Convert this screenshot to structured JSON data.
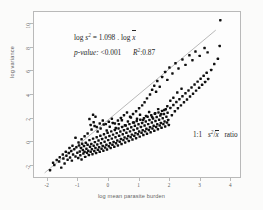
{
  "chart_data": {
    "type": "scatter",
    "title": "",
    "xlabel": "log mean parasite burden",
    "ylabel": "log variance",
    "xlim": [
      -2.45,
      4.35
    ],
    "ylim": [
      -3.1,
      11.0
    ],
    "xticks": [
      "-2",
      "-1",
      "0",
      "1",
      "2",
      "3",
      "4"
    ],
    "xtick_values": [
      -2,
      -1,
      0,
      1,
      2,
      3,
      4
    ],
    "yticks": [
      "10",
      "8",
      "6",
      "4",
      "2",
      "0",
      "-2"
    ],
    "ytick_values": [
      10,
      8,
      6,
      4,
      2,
      0,
      -2
    ],
    "grid": false,
    "legend": null,
    "marker_color": "#101010",
    "line_color": "#9a9a9a",
    "frame_color": "#b9b9b9",
    "regression_line": {
      "slope": 1.098,
      "x_start": -2.1,
      "y_start": -2.75,
      "x_end": 3.55,
      "y_end": 9.45
    },
    "annotations": {
      "equation": {
        "log_label": "log",
        "s_symbol": "s",
        "s_exponent": "2",
        "equals": "=",
        "slope_value": "1.098",
        "dot": ".",
        "log_label2": "log",
        "x_symbol": "x"
      },
      "stats": {
        "pvalue_label": "p-value:",
        "pvalue": "<0.001",
        "r2_label": "R",
        "r2_exponent": "2",
        "r2_sep": ":",
        "r2_value": "0.87"
      },
      "ratio": {
        "ratio_label": "1:1",
        "numerator": "s",
        "numerator_exp": "2",
        "slash": "/",
        "denominator": "x",
        "suffix": "ratio"
      }
    },
    "points": [
      [
        -1.92,
        -2.52
      ],
      [
        -1.78,
        -2.08
      ],
      [
        -1.62,
        -1.78
      ],
      [
        -1.55,
        -2.3
      ],
      [
        -1.48,
        -1.52
      ],
      [
        -1.44,
        -1.95
      ],
      [
        -1.38,
        -1.28
      ],
      [
        -1.34,
        -1.62
      ],
      [
        -1.3,
        -1.05
      ],
      [
        -1.26,
        -1.44
      ],
      [
        -1.22,
        -0.88
      ],
      [
        -1.2,
        -1.7
      ],
      [
        -1.16,
        -1.18
      ],
      [
        -1.12,
        -0.72
      ],
      [
        -1.08,
        -1.35
      ],
      [
        -1.05,
        -0.55
      ],
      [
        -1.02,
        -1.02
      ],
      [
        -0.99,
        -1.48
      ],
      [
        -0.96,
        -0.4
      ],
      [
        -0.94,
        -0.92
      ],
      [
        -0.92,
        -1.25
      ],
      [
        -0.9,
        -0.62
      ],
      [
        -0.88,
        -1.6
      ],
      [
        -0.86,
        -0.25
      ],
      [
        -0.84,
        -0.8
      ],
      [
        -0.82,
        -1.1
      ],
      [
        -0.8,
        -0.45
      ],
      [
        -0.78,
        -0.95
      ],
      [
        -0.76,
        -1.38
      ],
      [
        -0.74,
        -0.18
      ],
      [
        -0.72,
        -0.68
      ],
      [
        -0.7,
        -1.02
      ],
      [
        -0.68,
        -0.35
      ],
      [
        -0.66,
        -0.85
      ],
      [
        -0.64,
        -1.22
      ],
      [
        -0.62,
        0.05
      ],
      [
        -0.6,
        -0.52
      ],
      [
        -0.58,
        -0.95
      ],
      [
        -0.56,
        -0.28
      ],
      [
        -0.54,
        -0.72
      ],
      [
        -0.52,
        -1.15
      ],
      [
        -0.5,
        0.18
      ],
      [
        -0.5,
        2.22
      ],
      [
        -0.48,
        -0.42
      ],
      [
        -0.46,
        -0.88
      ],
      [
        -0.44,
        -0.12
      ],
      [
        -0.42,
        -0.62
      ],
      [
        -0.4,
        -1.05
      ],
      [
        -0.38,
        0.3
      ],
      [
        -0.36,
        -0.32
      ],
      [
        -0.34,
        -0.78
      ],
      [
        -0.32,
        0.02
      ],
      [
        -0.3,
        -0.55
      ],
      [
        -0.28,
        -0.95
      ],
      [
        -0.26,
        0.42
      ],
      [
        -0.24,
        -0.22
      ],
      [
        -0.22,
        -0.68
      ],
      [
        -0.2,
        0.15
      ],
      [
        -0.18,
        -0.45
      ],
      [
        -0.16,
        -0.85
      ],
      [
        -0.14,
        0.55
      ],
      [
        -0.12,
        -0.08
      ],
      [
        -0.1,
        -0.58
      ],
      [
        -0.08,
        0.28
      ],
      [
        -0.06,
        -0.35
      ],
      [
        -0.04,
        -0.75
      ],
      [
        -0.02,
        0.68
      ],
      [
        0.0,
        0.05
      ],
      [
        0.02,
        -0.48
      ],
      [
        0.04,
        0.4
      ],
      [
        0.06,
        -0.22
      ],
      [
        0.08,
        -0.62
      ],
      [
        0.1,
        0.8
      ],
      [
        0.12,
        0.18
      ],
      [
        0.14,
        -0.35
      ],
      [
        0.16,
        0.52
      ],
      [
        0.18,
        -0.1
      ],
      [
        0.2,
        -0.52
      ],
      [
        0.22,
        0.92
      ],
      [
        0.24,
        0.3
      ],
      [
        0.26,
        -0.22
      ],
      [
        0.28,
        0.65
      ],
      [
        0.3,
        0.02
      ],
      [
        0.32,
        -0.4
      ],
      [
        0.34,
        1.05
      ],
      [
        0.36,
        0.42
      ],
      [
        0.38,
        -0.08
      ],
      [
        0.4,
        0.78
      ],
      [
        0.42,
        0.15
      ],
      [
        0.44,
        -0.28
      ],
      [
        0.46,
        1.18
      ],
      [
        0.48,
        0.55
      ],
      [
        0.5,
        0.05
      ],
      [
        0.52,
        0.9
      ],
      [
        0.54,
        0.28
      ],
      [
        0.56,
        -0.15
      ],
      [
        0.58,
        1.3
      ],
      [
        0.6,
        0.68
      ],
      [
        0.62,
        0.18
      ],
      [
        0.64,
        1.02
      ],
      [
        0.66,
        0.4
      ],
      [
        0.68,
        -0.02
      ],
      [
        0.7,
        1.42
      ],
      [
        0.72,
        0.8
      ],
      [
        0.74,
        0.3
      ],
      [
        0.76,
        1.15
      ],
      [
        0.78,
        0.52
      ],
      [
        0.8,
        0.1
      ],
      [
        0.82,
        1.55
      ],
      [
        0.84,
        0.92
      ],
      [
        0.86,
        0.42
      ],
      [
        0.88,
        1.28
      ],
      [
        0.9,
        0.65
      ],
      [
        0.92,
        0.22
      ],
      [
        0.94,
        1.68
      ],
      [
        0.96,
        1.05
      ],
      [
        0.98,
        0.55
      ],
      [
        1.0,
        1.4
      ],
      [
        1.02,
        0.78
      ],
      [
        1.04,
        0.35
      ],
      [
        1.06,
        1.8
      ],
      [
        1.08,
        1.18
      ],
      [
        1.1,
        0.68
      ],
      [
        1.12,
        1.52
      ],
      [
        1.14,
        0.9
      ],
      [
        1.16,
        0.48
      ],
      [
        1.18,
        1.92
      ],
      [
        1.2,
        1.3
      ],
      [
        1.22,
        0.8
      ],
      [
        1.24,
        1.65
      ],
      [
        1.26,
        1.02
      ],
      [
        1.28,
        0.6
      ],
      [
        1.3,
        2.05
      ],
      [
        1.32,
        1.42
      ],
      [
        1.34,
        0.92
      ],
      [
        1.36,
        1.78
      ],
      [
        1.38,
        1.15
      ],
      [
        1.4,
        0.72
      ],
      [
        1.42,
        2.18
      ],
      [
        1.44,
        1.55
      ],
      [
        1.46,
        1.05
      ],
      [
        1.48,
        1.9
      ],
      [
        1.5,
        1.28
      ],
      [
        1.52,
        0.85
      ],
      [
        1.54,
        2.3
      ],
      [
        1.56,
        1.68
      ],
      [
        1.58,
        1.18
      ],
      [
        1.6,
        2.02
      ],
      [
        1.62,
        1.4
      ],
      [
        1.64,
        0.98
      ],
      [
        1.66,
        2.42
      ],
      [
        1.68,
        1.8
      ],
      [
        1.7,
        1.3
      ],
      [
        1.72,
        2.15
      ],
      [
        1.74,
        1.52
      ],
      [
        1.76,
        1.1
      ],
      [
        1.78,
        2.55
      ],
      [
        1.8,
        1.92
      ],
      [
        1.82,
        1.42
      ],
      [
        1.84,
        2.28
      ],
      [
        1.86,
        1.65
      ],
      [
        1.88,
        1.22
      ],
      [
        1.9,
        2.68
      ],
      [
        1.92,
        2.05
      ],
      [
        1.94,
        1.55
      ],
      [
        1.96,
        2.4
      ],
      [
        1.98,
        1.78
      ],
      [
        2.0,
        1.35
      ],
      [
        2.05,
        2.8
      ],
      [
        2.1,
        2.18
      ],
      [
        2.15,
        3.05
      ],
      [
        2.2,
        2.52
      ],
      [
        2.25,
        3.3
      ],
      [
        2.3,
        2.78
      ],
      [
        2.35,
        3.55
      ],
      [
        2.4,
        3.02
      ],
      [
        2.45,
        3.8
      ],
      [
        2.5,
        3.28
      ],
      [
        2.55,
        4.05
      ],
      [
        2.6,
        3.52
      ],
      [
        2.65,
        4.3
      ],
      [
        2.7,
        3.78
      ],
      [
        2.75,
        4.55
      ],
      [
        2.8,
        4.02
      ],
      [
        2.85,
        4.8
      ],
      [
        2.9,
        4.28
      ],
      [
        2.95,
        5.05
      ],
      [
        3.0,
        4.52
      ],
      [
        3.05,
        5.3
      ],
      [
        3.1,
        4.78
      ],
      [
        3.15,
        5.55
      ],
      [
        3.2,
        5.02
      ],
      [
        3.25,
        5.8
      ],
      [
        3.3,
        5.28
      ],
      [
        3.4,
        6.05
      ],
      [
        3.5,
        6.55
      ],
      [
        3.62,
        7.0
      ],
      [
        3.68,
        8.1
      ],
      [
        3.7,
        10.3
      ],
      [
        -0.55,
        0.95
      ],
      [
        -0.45,
        1.25
      ],
      [
        -0.35,
        0.78
      ],
      [
        -0.25,
        1.05
      ],
      [
        -0.15,
        1.38
      ],
      [
        -0.05,
        0.88
      ],
      [
        0.05,
        1.2
      ],
      [
        0.15,
        1.52
      ],
      [
        0.25,
        1.08
      ],
      [
        0.35,
        1.42
      ],
      [
        0.45,
        1.75
      ],
      [
        0.55,
        1.32
      ],
      [
        0.65,
        1.65
      ],
      [
        0.75,
        1.98
      ],
      [
        0.85,
        1.55
      ],
      [
        0.95,
        1.88
      ],
      [
        1.05,
        2.22
      ],
      [
        1.15,
        1.78
      ],
      [
        1.25,
        2.12
      ],
      [
        1.35,
        2.45
      ],
      [
        1.45,
        2.02
      ],
      [
        1.55,
        2.35
      ],
      [
        1.65,
        2.7
      ],
      [
        1.75,
        2.28
      ],
      [
        1.85,
        2.62
      ],
      [
        1.95,
        2.95
      ],
      [
        2.05,
        3.42
      ],
      [
        2.15,
        3.68
      ],
      [
        2.28,
        4.12
      ],
      [
        2.42,
        4.45
      ],
      [
        1.38,
        3.95
      ],
      [
        1.45,
        4.35
      ],
      [
        1.52,
        4.7
      ],
      [
        1.58,
        4.18
      ],
      [
        1.62,
        5.1
      ],
      [
        1.7,
        4.62
      ],
      [
        1.78,
        5.45
      ],
      [
        1.88,
        5.88
      ],
      [
        1.95,
        5.2
      ],
      [
        2.02,
        6.25
      ],
      [
        2.12,
        5.75
      ],
      [
        2.22,
        6.62
      ],
      [
        2.32,
        6.18
      ],
      [
        2.45,
        6.95
      ],
      [
        2.55,
        6.48
      ],
      [
        2.68,
        7.3
      ],
      [
        2.78,
        6.88
      ],
      [
        2.88,
        7.62
      ],
      [
        3.02,
        7.25
      ],
      [
        3.18,
        7.92
      ],
      [
        3.28,
        7.55
      ],
      [
        1.28,
        3.62
      ],
      [
        1.2,
        3.28
      ],
      [
        1.12,
        3.02
      ],
      [
        1.02,
        2.78
      ],
      [
        0.92,
        2.52
      ],
      [
        0.82,
        2.28
      ],
      [
        0.72,
        2.05
      ],
      [
        0.62,
        2.42
      ],
      [
        0.52,
        2.18
      ],
      [
        0.42,
        1.95
      ],
      [
        0.32,
        1.72
      ],
      [
        0.22,
        1.48
      ],
      [
        0.12,
        1.88
      ],
      [
        0.02,
        1.62
      ],
      [
        -0.08,
        1.42
      ],
      [
        -0.18,
        1.72
      ],
      [
        -0.28,
        1.48
      ],
      [
        -0.38,
        1.18
      ],
      [
        -0.48,
        1.58
      ],
      [
        -0.58,
        1.35
      ],
      [
        -0.68,
        0.62
      ],
      [
        -0.78,
        0.38
      ],
      [
        -0.88,
        0.12
      ],
      [
        -0.98,
        -0.15
      ],
      [
        -1.08,
        0.25
      ],
      [
        -1.18,
        -0.42
      ],
      [
        -1.28,
        -0.62
      ],
      [
        -1.4,
        -0.95
      ],
      [
        -1.5,
        -1.18
      ],
      [
        -1.6,
        -1.42
      ],
      [
        -1.7,
        -1.65
      ],
      [
        -1.82,
        -1.88
      ],
      [
        -0.62,
        1.85
      ],
      [
        -0.42,
        2.05
      ]
    ]
  }
}
